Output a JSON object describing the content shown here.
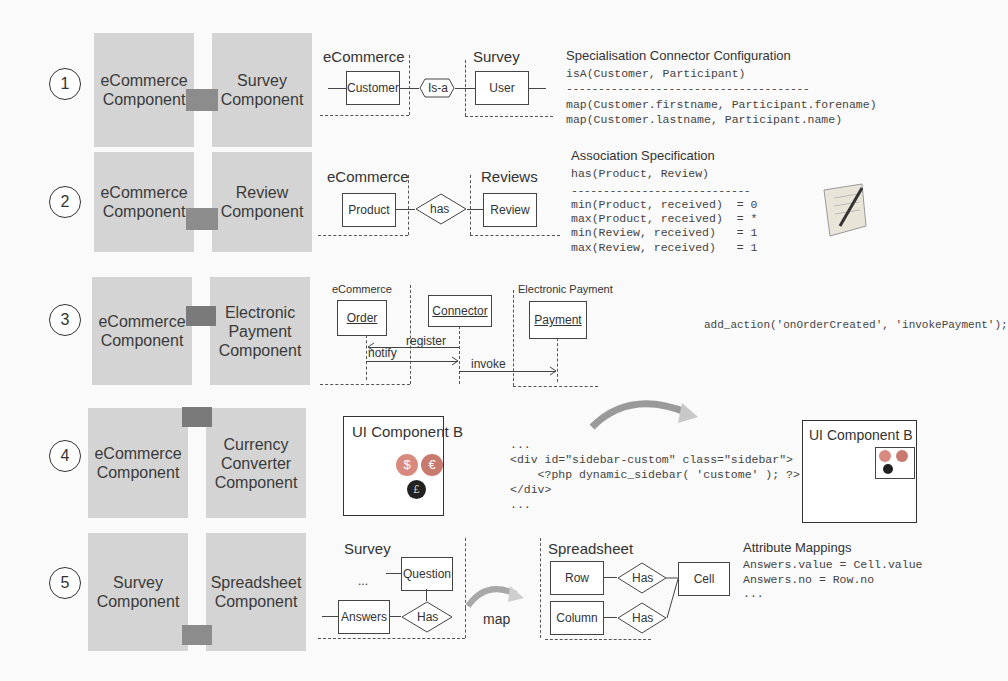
{
  "rows": [
    {
      "number": "1",
      "left_component": "eCommerce Component",
      "right_component": "Survey Component",
      "diagram": {
        "left_domain": "eCommerce",
        "right_domain": "Survey",
        "left_entity": "Customer",
        "relation": "Is-a",
        "right_entity": "User"
      },
      "spec": {
        "title": "Specialisation Connector Configuration",
        "header": "isA(Customer, Participant)",
        "separator": "--------------------------------------",
        "lines": [
          "map(Customer.firstname, Participant.forename)",
          "map(Customer.lastname, Participant.name)"
        ]
      }
    },
    {
      "number": "2",
      "left_component": "eCommerce Component",
      "right_component": "Review Component",
      "diagram": {
        "left_domain": "eCommerce",
        "right_domain": "Reviews",
        "left_entity": "Product",
        "relation": "has",
        "right_entity": "Review"
      },
      "spec": {
        "title": "Association Specification",
        "header": "has(Product, Review)",
        "separator": "----------------------------",
        "lines": [
          "min(Product, received)  = 0",
          "max(Product, received)  = *",
          "min(Review, received)   = 1",
          "max(Review, received)   = 1"
        ],
        "icon": "notepad-pen-icon"
      }
    },
    {
      "number": "3",
      "left_component": "eCommerce Component",
      "right_component": "Electronic Payment Component",
      "diagram": {
        "left_domain": "eCommerce",
        "right_domain": "Electronic Payment",
        "objects": [
          "Order",
          "Connector",
          "Payment"
        ],
        "messages": [
          "register",
          "notify",
          "invoke"
        ]
      },
      "code": "add_action('onOrderCreated', 'invokePayment');"
    },
    {
      "number": "4",
      "left_component": "eCommerce Component",
      "right_component": "Currency Converter Component",
      "ui_before": {
        "title": "UI Component B",
        "icons": [
          "dollar-coin-icon",
          "euro-coin-icon",
          "pound-coin-icon"
        ]
      },
      "code_lines": [
        "...",
        "<div id=\"sidebar-custom\" class=\"sidebar\">",
        "    <?php dynamic_sidebar( 'custome' ); ?>",
        "</div>",
        "..."
      ],
      "ui_after": {
        "title": "UI Component B"
      }
    },
    {
      "number": "5",
      "left_component": "Survey Component",
      "right_component": "Spreadsheet Component",
      "diagram": {
        "left_domain": "Survey",
        "right_domain": "Spreadsheet",
        "left_ellipsis": "...",
        "question": "Question",
        "answers": "Answers",
        "left_relation": "Has",
        "map_label": "map",
        "row": "Row",
        "column": "Column",
        "row_relation": "Has",
        "column_relation": "Has",
        "cell": "Cell"
      },
      "spec": {
        "title": "Attribute Mappings",
        "lines": [
          "Answers.value = Cell.value",
          "Answers.no = Row.no",
          "..."
        ]
      }
    }
  ],
  "coin_symbols": {
    "dollar": "$",
    "euro": "€",
    "pound": "£"
  }
}
